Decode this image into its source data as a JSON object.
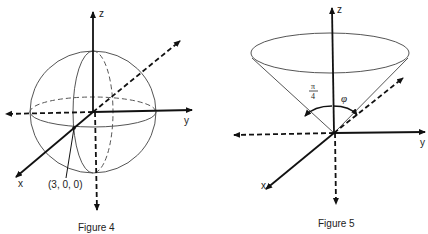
{
  "figure4": {
    "caption": "Figure 4",
    "axis_labels": {
      "x": "x",
      "y": "y",
      "z": "z"
    },
    "point_label": "(3, 0, 0)",
    "shape": "sphere"
  },
  "figure5": {
    "caption": "Figure 5",
    "axis_labels": {
      "x": "x",
      "y": "y",
      "z": "z"
    },
    "angle_label_numerator": "π",
    "angle_label_denominator": "4",
    "angle_label_phi": "φ",
    "shape": "cone"
  },
  "colors": {
    "axis": "#111111",
    "surface": "#555555",
    "background": "#ffffff"
  }
}
